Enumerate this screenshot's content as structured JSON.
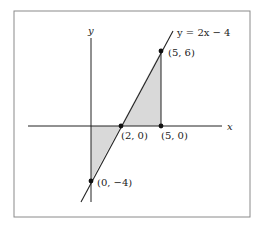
{
  "figure": {
    "equation_label": "y = 2x − 4",
    "axis_labels": {
      "x": "x",
      "y": "y"
    },
    "points": [
      {
        "label": "(5, 6)",
        "x": 5,
        "y": 6
      },
      {
        "label": "(2, 0)",
        "x": 2,
        "y": 0
      },
      {
        "label": "(5, 0)",
        "x": 5,
        "y": 0
      },
      {
        "label": "(0, −4)",
        "x": 0,
        "y": -4
      }
    ],
    "shaded_regions": [
      {
        "name": "triangle-below-axis",
        "vertices": [
          [
            0,
            0
          ],
          [
            2,
            0
          ],
          [
            0,
            -4
          ]
        ]
      },
      {
        "name": "triangle-above-axis",
        "vertices": [
          [
            2,
            0
          ],
          [
            5,
            0
          ],
          [
            5,
            6
          ]
        ]
      }
    ],
    "colors": {
      "fill": "#d9d9d9",
      "stroke": "#222222",
      "frame": "#8a8a8a"
    }
  }
}
